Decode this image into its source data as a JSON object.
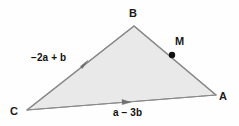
{
  "figure": {
    "background_color": "#fefefe",
    "fill_color": "#e9e9e9",
    "stroke_color": "#8a8a8a",
    "marker_color": "#111111",
    "text_color": "#1a1a1a"
  },
  "vertices": {
    "a": {
      "label": "A",
      "x": 216,
      "y": 95
    },
    "b": {
      "label": "B",
      "x": 134,
      "y": 26
    },
    "c": {
      "label": "C",
      "x": 27,
      "y": 110
    }
  },
  "points": {
    "m": {
      "label": "M",
      "x": 172,
      "y": 55
    }
  },
  "vectors": [
    {
      "name": "side-cb",
      "label": "−2a + b",
      "parts": {
        "coef1": "−2",
        "sym1": "a",
        "op": "+",
        "coef2": "",
        "sym2": "b"
      },
      "from": "C",
      "to": "B",
      "direction": "toward-b"
    },
    {
      "name": "side-ca",
      "label": "a − 3b",
      "parts": {
        "coef1": "",
        "sym1": "a",
        "op": "−",
        "coef2": "3",
        "sym2": "b"
      },
      "from": "C",
      "to": "A",
      "direction": "toward-a"
    }
  ]
}
